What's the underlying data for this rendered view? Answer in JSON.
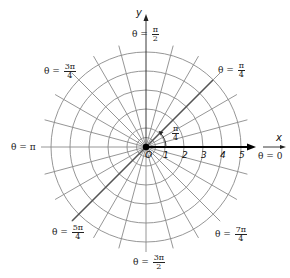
{
  "diagram": {
    "center": {
      "x": 146,
      "y": 147
    },
    "ring_spacing_px": 19,
    "rings": [
      1,
      2,
      3,
      4,
      5
    ],
    "radial_step_degrees": 15,
    "colors": {
      "grid": "#8a8a8a",
      "axis": "#000000",
      "highlight_ray": "#555555",
      "text": "#222222"
    },
    "axes": {
      "x_label": "x",
      "y_label": "y"
    },
    "origin_label": "O",
    "radius_ticks": [
      "1",
      "2",
      "3",
      "4",
      "5"
    ],
    "angle_marker": {
      "num": "π",
      "den": "4"
    },
    "angle_labels": {
      "theta_0": {
        "prefix": "θ = ",
        "value": "0"
      },
      "theta_pi_4": {
        "prefix": "θ = ",
        "num": "π",
        "den": "4"
      },
      "theta_pi_2": {
        "prefix": "θ = ",
        "num": "π",
        "den": "2"
      },
      "theta_3pi_4": {
        "prefix": "θ = ",
        "num": "3π",
        "den": "4"
      },
      "theta_pi": {
        "prefix": "θ = ",
        "value": "π"
      },
      "theta_5pi_4": {
        "prefix": "θ = ",
        "num": "5π",
        "den": "4"
      },
      "theta_3pi_2": {
        "prefix": "θ = ",
        "num": "3π",
        "den": "2"
      },
      "theta_7pi_4": {
        "prefix": "θ = ",
        "num": "7π",
        "den": "4"
      }
    }
  }
}
